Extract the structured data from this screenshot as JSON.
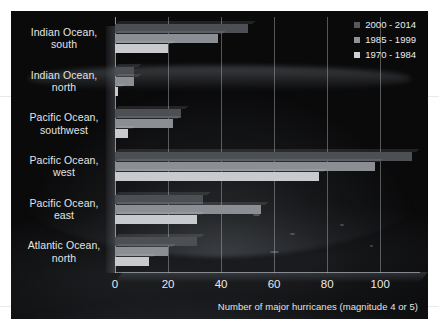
{
  "chart_data": {
    "type": "bar",
    "orientation": "horizontal",
    "title": "",
    "subtitle": "",
    "xlabel": "Number of major hurricanes (magnitude 4 or 5)",
    "ylabel": "",
    "xlim": [
      0,
      115
    ],
    "xticks": [
      0,
      20,
      40,
      60,
      80,
      100
    ],
    "xtick_labels": [
      "0",
      "20",
      "40",
      "60",
      "80",
      "100"
    ],
    "grid": true,
    "legend_position": "top-right",
    "categories": [
      "Indian Ocean, south",
      "Indian Ocean, north",
      "Pacific Ocean, southwest",
      "Pacific Ocean, west",
      "Pacific Ocean, east",
      "Atlantic Ocean, north"
    ],
    "category_lines": [
      [
        "Indian Ocean,",
        "south"
      ],
      [
        "Indian Ocean,",
        "north"
      ],
      [
        "Pacific Ocean,",
        "southwest"
      ],
      [
        "Pacific Ocean,",
        "west"
      ],
      [
        "Pacific Ocean,",
        "east"
      ],
      [
        "Atlantic Ocean,",
        "north"
      ]
    ],
    "series": [
      {
        "name": "2000 - 2014",
        "color": "#4c4f54",
        "values": [
          50,
          7,
          25,
          112,
          33,
          31
        ]
      },
      {
        "name": "1985 - 1999",
        "color": "#8b8e93",
        "values": [
          39,
          7,
          22,
          98,
          55,
          20
        ]
      },
      {
        "name": "1970 - 1984",
        "color": "#c8cacd",
        "values": [
          20,
          1,
          5,
          77,
          31,
          13
        ]
      }
    ]
  },
  "legend": {
    "items": [
      {
        "label": "2000 - 2014",
        "swatch": "legend-swatch-2000-2014"
      },
      {
        "label": "1985 - 1999",
        "swatch": "legend-swatch-1985-1999"
      },
      {
        "label": "1970 - 1984",
        "swatch": "legend-swatch-1970-1984"
      }
    ]
  },
  "axis": {
    "x_title": "Number of major hurricanes (magnitude 4 or 5)",
    "x_tick_labels": [
      "0",
      "20",
      "40",
      "60",
      "80",
      "100"
    ]
  },
  "colors": {
    "chart_background": "#0a0a0b",
    "page_background": "#ffffff",
    "text": "#e9eaec",
    "gridline": "#afb4bc",
    "series_2000_2014": "#4c4f54",
    "series_1985_1999": "#8b8e93",
    "series_1970_1984": "#c8cacd"
  }
}
